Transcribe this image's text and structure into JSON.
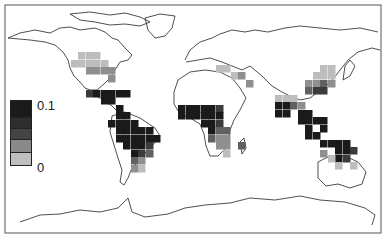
{
  "map": {
    "type": "world choropleth grid",
    "frame": {
      "x": 5,
      "y": 5,
      "w": 376,
      "h": 228
    },
    "cell_size": 7.5,
    "colors": [
      "#bdbdbd",
      "#8f8f8f",
      "#616161",
      "#3b3b3b",
      "#1a1a1a"
    ],
    "legend": {
      "max_label": "0.1",
      "min_label": "0",
      "swatches": [
        "#1a1a1a",
        "#2e2e2e",
        "#444444",
        "#8a8a8a",
        "#bfbfbf"
      ]
    },
    "regions": [
      {
        "name": "North America (US)",
        "cells": [
          [
            78,
            52,
            0
          ],
          [
            86,
            52,
            0
          ],
          [
            93,
            52,
            0
          ],
          [
            71,
            60,
            0
          ],
          [
            78,
            60,
            0
          ],
          [
            86,
            60,
            0
          ],
          [
            93,
            60,
            0
          ],
          [
            101,
            60,
            0
          ],
          [
            86,
            67,
            1
          ],
          [
            93,
            67,
            1
          ],
          [
            101,
            67,
            1
          ],
          [
            108,
            67,
            1
          ],
          [
            108,
            75,
            1
          ]
        ]
      },
      {
        "name": "Mexico / Central America",
        "cells": [
          [
            86,
            90,
            3
          ],
          [
            93,
            90,
            4
          ],
          [
            101,
            90,
            4
          ],
          [
            108,
            90,
            4
          ],
          [
            116,
            90,
            4
          ],
          [
            123,
            90,
            4
          ],
          [
            101,
            97,
            4
          ],
          [
            108,
            97,
            4
          ],
          [
            116,
            105,
            4
          ],
          [
            116,
            112,
            4
          ],
          [
            123,
            112,
            4
          ],
          [
            116,
            120,
            4
          ],
          [
            123,
            120,
            4
          ],
          [
            131,
            120,
            4
          ]
        ]
      },
      {
        "name": "South America",
        "cells": [
          [
            108,
            120,
            4
          ],
          [
            116,
            127,
            4
          ],
          [
            123,
            127,
            4
          ],
          [
            131,
            127,
            4
          ],
          [
            138,
            127,
            4
          ],
          [
            146,
            127,
            4
          ],
          [
            116,
            135,
            4
          ],
          [
            123,
            135,
            4
          ],
          [
            131,
            135,
            4
          ],
          [
            138,
            135,
            4
          ],
          [
            146,
            135,
            4
          ],
          [
            153,
            135,
            4
          ],
          [
            123,
            142,
            4
          ],
          [
            131,
            142,
            4
          ],
          [
            138,
            142,
            4
          ],
          [
            146,
            142,
            3
          ],
          [
            131,
            150,
            4
          ],
          [
            138,
            150,
            3
          ],
          [
            146,
            150,
            2
          ],
          [
            131,
            157,
            2
          ],
          [
            138,
            157,
            1
          ],
          [
            131,
            165,
            1
          ],
          [
            138,
            165,
            0
          ]
        ]
      },
      {
        "name": "Africa",
        "cells": [
          [
            178,
            105,
            4
          ],
          [
            186,
            105,
            4
          ],
          [
            193,
            105,
            4
          ],
          [
            201,
            105,
            4
          ],
          [
            208,
            105,
            4
          ],
          [
            216,
            105,
            3
          ],
          [
            178,
            112,
            4
          ],
          [
            186,
            112,
            4
          ],
          [
            193,
            112,
            4
          ],
          [
            201,
            112,
            4
          ],
          [
            208,
            112,
            4
          ],
          [
            216,
            112,
            4
          ],
          [
            201,
            120,
            4
          ],
          [
            208,
            120,
            4
          ],
          [
            216,
            120,
            3
          ],
          [
            208,
            127,
            4
          ],
          [
            216,
            127,
            2
          ],
          [
            223,
            127,
            2
          ],
          [
            208,
            135,
            2
          ],
          [
            216,
            135,
            1
          ],
          [
            223,
            135,
            1
          ],
          [
            216,
            142,
            1
          ],
          [
            223,
            142,
            1
          ],
          [
            223,
            150,
            0
          ],
          [
            238,
            142,
            2
          ]
        ]
      },
      {
        "name": "Mediterranean / Middle East",
        "cells": [
          [
            216,
            65,
            0
          ],
          [
            223,
            65,
            0
          ],
          [
            231,
            72,
            0
          ],
          [
            238,
            72,
            1
          ],
          [
            246,
            80,
            1
          ]
        ]
      },
      {
        "name": "South Asia",
        "cells": [
          [
            275,
            95,
            0
          ],
          [
            283,
            95,
            0
          ],
          [
            290,
            95,
            0
          ],
          [
            275,
            102,
            4
          ],
          [
            283,
            102,
            4
          ],
          [
            290,
            102,
            2
          ],
          [
            298,
            102,
            1
          ],
          [
            275,
            110,
            4
          ],
          [
            283,
            110,
            4
          ],
          [
            298,
            110,
            4
          ],
          [
            305,
            110,
            4
          ]
        ]
      },
      {
        "name": "China / East Asia",
        "cells": [
          [
            320,
            65,
            0
          ],
          [
            328,
            65,
            0
          ],
          [
            313,
            72,
            0
          ],
          [
            320,
            72,
            0
          ],
          [
            328,
            72,
            0
          ],
          [
            305,
            80,
            1
          ],
          [
            313,
            80,
            1
          ],
          [
            320,
            80,
            2
          ],
          [
            328,
            80,
            1
          ],
          [
            305,
            87,
            2
          ],
          [
            313,
            87,
            3
          ],
          [
            320,
            87,
            3
          ]
        ]
      },
      {
        "name": "Southeast Asia",
        "cells": [
          [
            298,
            117,
            4
          ],
          [
            305,
            117,
            4
          ],
          [
            313,
            117,
            4
          ],
          [
            320,
            117,
            4
          ],
          [
            305,
            125,
            4
          ],
          [
            320,
            125,
            4
          ],
          [
            305,
            132,
            4
          ],
          [
            313,
            132,
            4
          ],
          [
            320,
            140,
            4
          ],
          [
            328,
            140,
            4
          ],
          [
            335,
            140,
            4
          ],
          [
            343,
            140,
            4
          ],
          [
            335,
            147,
            4
          ],
          [
            343,
            147,
            4
          ],
          [
            350,
            147,
            3
          ],
          [
            335,
            155,
            4
          ],
          [
            343,
            155,
            3
          ]
        ]
      },
      {
        "name": "Northern Australia",
        "cells": [
          [
            320,
            150,
            1
          ],
          [
            328,
            155,
            0
          ],
          [
            335,
            162,
            0
          ],
          [
            350,
            162,
            0
          ]
        ]
      }
    ]
  }
}
